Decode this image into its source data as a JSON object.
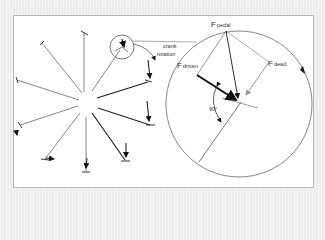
{
  "figure": {
    "labels": {
      "crank": "crank",
      "rotation": "rotation",
      "f_pedal_main": "F",
      "f_pedal_sub": "pedal",
      "f_driven_main": "F",
      "f_driven_sub": "driven",
      "f_dead_main": "F",
      "f_dead_sub": "dead",
      "angle": "90°"
    },
    "colors": {
      "background": "#ececec",
      "frame": "#ffffff",
      "line": "#555555",
      "bold_line": "#111111",
      "gray_arrow": "#999999"
    },
    "left_panel": {
      "description": "Crank positions around a circle with pedal force arrows",
      "spoke_count": 8
    },
    "right_panel": {
      "description": "Magnified crank circle showing F_pedal split into F_driven (tangential) and F_dead (radial)"
    }
  }
}
